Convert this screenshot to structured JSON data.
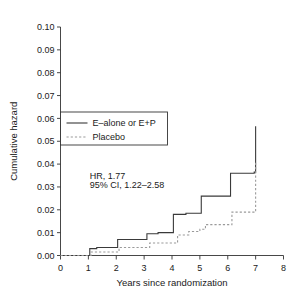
{
  "chart_data": {
    "type": "line",
    "title": "",
    "subtitle": "",
    "xlabel": "Years since randomization",
    "ylabel": "Cumulative hazard",
    "xlim": [
      0,
      8
    ],
    "ylim": [
      0,
      0.1
    ],
    "xticks": [
      0,
      1,
      2,
      3,
      4,
      5,
      6,
      7,
      8
    ],
    "xtick_labels": [
      "0",
      "1",
      "2",
      "3",
      "4",
      "5",
      "6",
      "7",
      "8"
    ],
    "yticks": [
      0.0,
      0.01,
      0.02,
      0.03,
      0.04,
      0.05,
      0.06,
      0.07,
      0.08,
      0.09,
      0.1
    ],
    "ytick_labels": [
      "0.00",
      "0.01",
      "0.02",
      "0.03",
      "0.04",
      "0.05",
      "0.06",
      "0.07",
      "0.08",
      "0.09",
      "0.10"
    ],
    "grid": false,
    "legend_position": "upper-left-inside",
    "step_style": "post",
    "series": [
      {
        "name": "E–alone or E+P",
        "style": "solid",
        "color": "#3a3a3a",
        "x": [
          0.0,
          1.0,
          1.05,
          1.3,
          2.0,
          2.05,
          3.0,
          3.1,
          3.5,
          4.0,
          4.05,
          4.5,
          5.0,
          5.05,
          6.0,
          6.1,
          6.95,
          7.0
        ],
        "y": [
          0.0,
          0.0,
          0.003,
          0.0035,
          0.0035,
          0.007,
          0.007,
          0.0095,
          0.01,
          0.01,
          0.018,
          0.0185,
          0.0185,
          0.026,
          0.026,
          0.036,
          0.0365,
          0.0566
        ]
      },
      {
        "name": "Placebo",
        "style": "dashed",
        "color": "#9a9a9a",
        "x": [
          0.0,
          1.0,
          1.1,
          2.0,
          2.1,
          3.0,
          3.2,
          4.0,
          4.2,
          4.6,
          5.0,
          5.2,
          6.0,
          6.15,
          6.95,
          7.0
        ],
        "y": [
          0.0,
          0.0,
          0.0015,
          0.0015,
          0.0035,
          0.0035,
          0.0055,
          0.0055,
          0.009,
          0.0105,
          0.0115,
          0.0135,
          0.0135,
          0.019,
          0.019,
          0.0415
        ]
      }
    ],
    "annotations": [
      {
        "text": "HR, 1.77",
        "x": 1.05,
        "y": 0.0335
      },
      {
        "text": "95% CI, 1.22–2.58",
        "x": 1.05,
        "y": 0.0295
      }
    ]
  },
  "legend": {
    "items": [
      {
        "label": "E–alone or E+P",
        "style": "solid"
      },
      {
        "label": "Placebo",
        "style": "dashed"
      }
    ]
  },
  "axes": {
    "x_title": "Years since randomization",
    "y_title": "Cumulative hazard"
  }
}
